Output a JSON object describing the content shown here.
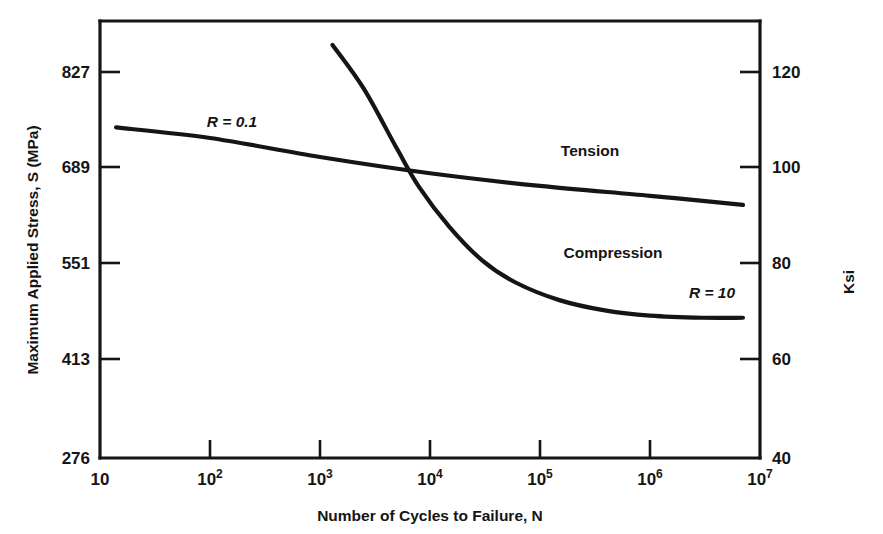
{
  "chart_data": {
    "type": "line",
    "title": "",
    "xlabel": "Number of Cycles to Failure, N",
    "ylabel": "Maximum Applied Stress, S (MPa)",
    "y2label": "Ksi",
    "xscale": "log",
    "xlim": [
      10,
      10000000
    ],
    "ylim": [
      276,
      896
    ],
    "y2lim": [
      40,
      130
    ],
    "grid": false,
    "legend_position": "inline-annotations",
    "x_ticks": [
      {
        "value": 10,
        "base": "10",
        "exponent": ""
      },
      {
        "value": 100,
        "base": "10",
        "exponent": "2"
      },
      {
        "value": 1000,
        "base": "10",
        "exponent": "3"
      },
      {
        "value": 10000,
        "base": "10",
        "exponent": "4"
      },
      {
        "value": 100000,
        "base": "10",
        "exponent": "5"
      },
      {
        "value": 1000000,
        "base": "10",
        "exponent": "6"
      },
      {
        "value": 10000000,
        "base": "10",
        "exponent": "7"
      }
    ],
    "y_ticks_left": [
      276,
      413,
      551,
      689,
      827
    ],
    "y_ticks_right": [
      40,
      60,
      80,
      100,
      120
    ],
    "series": [
      {
        "name": "Tension",
        "label": "Tension",
        "ratio_label": "R = 0.1",
        "color": "#151515",
        "points": [
          {
            "x": 14,
            "y": 745
          },
          {
            "x": 100,
            "y": 730
          },
          {
            "x": 1000,
            "y": 703
          },
          {
            "x": 10000,
            "y": 680
          },
          {
            "x": 100000,
            "y": 662
          },
          {
            "x": 1000000,
            "y": 648
          },
          {
            "x": 7000000,
            "y": 635
          }
        ]
      },
      {
        "name": "Compression",
        "label": "Compression",
        "ratio_label": "R = 10",
        "color": "#151515",
        "points": [
          {
            "x": 1300,
            "y": 862
          },
          {
            "x": 2500,
            "y": 800
          },
          {
            "x": 5000,
            "y": 715
          },
          {
            "x": 8000,
            "y": 660
          },
          {
            "x": 15000,
            "y": 604
          },
          {
            "x": 30000,
            "y": 556
          },
          {
            "x": 60000,
            "y": 525
          },
          {
            "x": 150000,
            "y": 500
          },
          {
            "x": 400000,
            "y": 485
          },
          {
            "x": 1000000,
            "y": 478
          },
          {
            "x": 3000000,
            "y": 475
          },
          {
            "x": 7000000,
            "y": 475
          }
        ]
      }
    ],
    "annotations": [
      {
        "name": "tension-ratio",
        "text": "R = 0.1",
        "x_px": 232,
        "y_px": 127,
        "italic": true
      },
      {
        "name": "tension-series",
        "text": "Tension",
        "x_px": 590,
        "y_px": 156,
        "italic": false
      },
      {
        "name": "compression-series",
        "text": "Compression",
        "x_px": 613,
        "y_px": 258,
        "italic": false
      },
      {
        "name": "compression-ratio",
        "text": "R = 10",
        "x_px": 712,
        "y_px": 298,
        "italic": true
      }
    ]
  }
}
